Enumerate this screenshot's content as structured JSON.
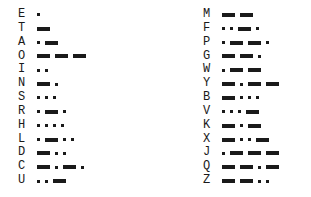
{
  "chart_title": "",
  "colors": {
    "ink": "#1a1a1a",
    "background": "#ffffff"
  },
  "chart_data": {
    "type": "table",
    "symbol_legend": {
      ".": "dot",
      "-": "dash"
    },
    "columns": [
      {
        "name": "left",
        "entries": [
          {
            "letter": "E",
            "code": "."
          },
          {
            "letter": "T",
            "code": "-"
          },
          {
            "letter": "A",
            "code": ".-"
          },
          {
            "letter": "O",
            "code": "---"
          },
          {
            "letter": "I",
            "code": ".."
          },
          {
            "letter": "N",
            "code": "-."
          },
          {
            "letter": "S",
            "code": "..."
          },
          {
            "letter": "R",
            "code": ".-."
          },
          {
            "letter": "H",
            "code": "...."
          },
          {
            "letter": "L",
            "code": ".-.."
          },
          {
            "letter": "D",
            "code": "-.."
          },
          {
            "letter": "C",
            "code": "-.-."
          },
          {
            "letter": "U",
            "code": "..-"
          }
        ]
      },
      {
        "name": "right",
        "entries": [
          {
            "letter": "M",
            "code": "--"
          },
          {
            "letter": "F",
            "code": "..-."
          },
          {
            "letter": "P",
            "code": ".--."
          },
          {
            "letter": "G",
            "code": "--."
          },
          {
            "letter": "W",
            "code": ".--"
          },
          {
            "letter": "Y",
            "code": "-.--"
          },
          {
            "letter": "B",
            "code": "-..."
          },
          {
            "letter": "V",
            "code": "...-"
          },
          {
            "letter": "K",
            "code": "-.-"
          },
          {
            "letter": "X",
            "code": "-..-"
          },
          {
            "letter": "J",
            "code": ".---"
          },
          {
            "letter": "Q",
            "code": "--.-"
          },
          {
            "letter": "Z",
            "code": "--.."
          }
        ]
      }
    ]
  }
}
